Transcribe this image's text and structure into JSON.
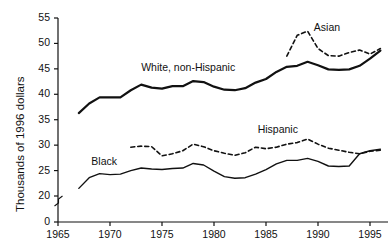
{
  "chart_data": {
    "type": "line",
    "title": "",
    "subtitle": "",
    "xlabel": "",
    "ylabel": "Thousands of 1996 dollars",
    "xlim": [
      1965,
      1996
    ],
    "ylim": [
      0,
      55
    ],
    "y_axis_break": true,
    "y_break_between": [
      0,
      20
    ],
    "grid": false,
    "legend_position": "inline-annotations",
    "xticks": [
      1965,
      1970,
      1975,
      1980,
      1985,
      1990,
      1995
    ],
    "xtick_labels": [
      "1965",
      "1970",
      "1975",
      "1980",
      "1985",
      "1990",
      "1995"
    ],
    "yticks": [
      0,
      20,
      25,
      30,
      35,
      40,
      45,
      50,
      55
    ],
    "ytick_labels": [
      "0",
      "20",
      "25",
      "30",
      "35",
      "40",
      "45",
      "50",
      "55"
    ],
    "series": [
      {
        "name": "White, non-Hispanic",
        "style": "solid",
        "width": 2.2,
        "color": "#111111",
        "label_x": 1973.0,
        "label_y": 45.2,
        "x": [
          1967,
          1968,
          1969,
          1970,
          1971,
          1972,
          1973,
          1974,
          1975,
          1976,
          1977,
          1978,
          1979,
          1980,
          1981,
          1982,
          1983,
          1984,
          1985,
          1986,
          1987,
          1988,
          1989,
          1990,
          1991,
          1992,
          1993,
          1994,
          1995,
          1996
        ],
        "values": [
          36.3,
          38.2,
          39.4,
          39.4,
          39.4,
          40.8,
          41.9,
          41.3,
          41.1,
          41.6,
          41.6,
          42.6,
          42.4,
          41.5,
          40.9,
          40.8,
          41.2,
          42.3,
          43.0,
          44.4,
          45.4,
          45.6,
          46.4,
          45.7,
          44.9,
          44.8,
          44.9,
          45.6,
          47.0,
          48.6
        ],
        "label": "White, non-Hispanic"
      },
      {
        "name": "Asian",
        "style": "dashed",
        "width": 1.6,
        "color": "#111111",
        "label_x": 1989.6,
        "label_y": 53.1,
        "x": [
          1987,
          1988,
          1989,
          1990,
          1991,
          1992,
          1993,
          1994,
          1995,
          1996
        ],
        "values": [
          47.5,
          51.6,
          52.4,
          49.0,
          47.6,
          47.5,
          48.2,
          48.7,
          47.9,
          49.0
        ],
        "label": "Asian"
      },
      {
        "name": "Black",
        "style": "solid",
        "width": 1.4,
        "color": "#111111",
        "label_x": 1968.2,
        "label_y": 26.6,
        "x": [
          1967,
          1968,
          1969,
          1970,
          1971,
          1972,
          1973,
          1974,
          1975,
          1976,
          1977,
          1978,
          1979,
          1980,
          1981,
          1982,
          1983,
          1984,
          1985,
          1986,
          1987,
          1988,
          1989,
          1990,
          1991,
          1992,
          1993,
          1994,
          1995,
          1996
        ],
        "values": [
          21.5,
          23.6,
          24.4,
          24.2,
          24.3,
          25.0,
          25.5,
          25.3,
          25.2,
          25.4,
          25.5,
          26.4,
          26.1,
          24.9,
          23.8,
          23.5,
          23.6,
          24.3,
          25.2,
          26.3,
          27.0,
          27.0,
          27.4,
          26.8,
          25.9,
          25.8,
          25.9,
          28.3,
          28.9,
          29.2
        ],
        "label": "Black"
      },
      {
        "name": "Hispanic",
        "style": "dashed",
        "width": 1.6,
        "color": "#111111",
        "label_x": 1984.2,
        "label_y": 33.0,
        "x": [
          1972,
          1973,
          1974,
          1975,
          1976,
          1977,
          1978,
          1979,
          1980,
          1981,
          1982,
          1983,
          1984,
          1985,
          1986,
          1987,
          1988,
          1989,
          1990,
          1991,
          1992,
          1993,
          1994,
          1995,
          1996
        ],
        "values": [
          29.6,
          29.8,
          29.7,
          27.9,
          28.3,
          28.9,
          30.2,
          29.7,
          28.9,
          28.4,
          28.0,
          28.5,
          29.6,
          29.3,
          29.6,
          30.2,
          30.5,
          31.2,
          30.2,
          29.4,
          29.0,
          28.6,
          28.3,
          28.8,
          29.0
        ],
        "label": "Hispanic"
      }
    ]
  }
}
